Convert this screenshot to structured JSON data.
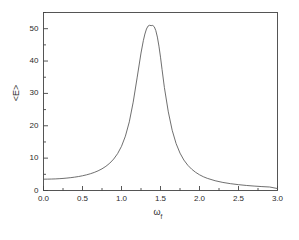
{
  "chart_data": {
    "type": "line",
    "title": "",
    "subtitle": "",
    "xlabel": "ω",
    "xlabel_subscript": "f",
    "ylabel": "<E>",
    "xlim": [
      0.0,
      3.0
    ],
    "ylim": [
      0.0,
      55.0
    ],
    "xticks": [
      0.0,
      0.5,
      1.0,
      1.5,
      2.0,
      2.5,
      3.0
    ],
    "xticklabels": [
      "0.0",
      "0.5",
      "1.0",
      "1.5",
      "2.0",
      "2.5",
      "3.0"
    ],
    "yticks": [
      0,
      10,
      20,
      30,
      40,
      50
    ],
    "yticklabels": [
      "0",
      "10",
      "20",
      "30",
      "40",
      "50"
    ],
    "x_minor_ticks_per_interval": 2,
    "y_minor_ticks_per_interval": 2,
    "grid": false,
    "legend": null,
    "line_color": "#555555",
    "frame_color": "#444444",
    "background": "#ffffff",
    "annotations": [],
    "peak": {
      "x": 1.4,
      "y": 51.0
    },
    "baseline_at_x0": 3.5,
    "value_at_xmax": 0.5,
    "series": [
      {
        "name": "<E>",
        "x": [
          0.0,
          0.05,
          0.1,
          0.15,
          0.2,
          0.25,
          0.3,
          0.35,
          0.4,
          0.45,
          0.5,
          0.55,
          0.6,
          0.65,
          0.7,
          0.75,
          0.8,
          0.85,
          0.9,
          0.95,
          1.0,
          1.05,
          1.1,
          1.15,
          1.2,
          1.25,
          1.28,
          1.3,
          1.32,
          1.34,
          1.36,
          1.38,
          1.4,
          1.42,
          1.44,
          1.46,
          1.48,
          1.5,
          1.52,
          1.55,
          1.6,
          1.65,
          1.7,
          1.75,
          1.8,
          1.85,
          1.9,
          1.95,
          2.0,
          2.05,
          2.1,
          2.2,
          2.3,
          2.4,
          2.5,
          2.6,
          2.7,
          2.8,
          2.9,
          3.0
        ],
        "y": [
          3.5,
          3.51,
          3.54,
          3.58,
          3.65,
          3.73,
          3.84,
          3.97,
          4.13,
          4.32,
          4.55,
          4.83,
          5.17,
          5.58,
          6.08,
          6.7,
          7.47,
          8.45,
          9.72,
          11.39,
          13.65,
          16.79,
          21.21,
          27.3,
          34.8,
          42.48,
          46.3,
          48.35,
          49.9,
          50.8,
          51.05,
          50.95,
          51.0,
          50.6,
          49.4,
          47.4,
          44.6,
          41.2,
          37.4,
          31.8,
          24.3,
          18.6,
          14.5,
          11.55,
          9.4,
          7.8,
          6.58,
          5.62,
          4.86,
          4.25,
          3.76,
          3.02,
          2.49,
          2.1,
          1.8,
          1.56,
          1.37,
          1.21,
          1.08,
          0.6
        ]
      }
    ]
  },
  "axis_label_y_text": "<E>",
  "axis_label_x_base": "ω",
  "axis_label_x_sub": "f"
}
